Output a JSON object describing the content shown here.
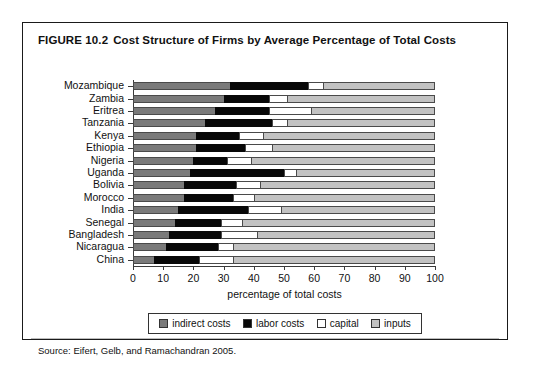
{
  "figure": {
    "number": "FIGURE 10.2",
    "title": "Cost Structure of Firms by Average Percentage of Total Costs",
    "source": "Source: Eifert, Gelb, and Ramachandran 2005."
  },
  "colors": {
    "indirect": "#7a7a7a",
    "labor": "#080808",
    "capital": "#ffffff",
    "inputs": "#c2c2c2",
    "frame": "#1a1a1a",
    "axis": "#3a3a3a"
  },
  "chart_data": {
    "type": "bar",
    "orientation": "horizontal",
    "stacked": true,
    "stacked_mode": "percent",
    "title": "Cost Structure of Firms by Average Percentage of Total Costs",
    "xlabel": "percentage of total costs",
    "ylabel": "",
    "xlim": [
      0,
      100
    ],
    "xticks": [
      0,
      10,
      20,
      30,
      40,
      50,
      60,
      70,
      80,
      90,
      100
    ],
    "xticklabels": [
      "0",
      "10",
      "20",
      "30",
      "40",
      "50",
      "60",
      "70",
      "80",
      "90",
      "100"
    ],
    "grid": false,
    "legend_position": "bottom",
    "legend": [
      "indirect costs",
      "labor costs",
      "capital",
      "inputs"
    ],
    "categories": [
      "Mozambique",
      "Zambia",
      "Eritrea",
      "Tanzania",
      "Kenya",
      "Ethiopia",
      "Nigeria",
      "Uganda",
      "Bolivia",
      "Morocco",
      "India",
      "Senegal",
      "Bangladesh",
      "Nicaragua",
      "China"
    ],
    "series": [
      {
        "name": "indirect costs",
        "color": "#7a7a7a",
        "values": [
          32,
          30,
          27,
          24,
          21,
          21,
          20,
          19,
          17,
          17,
          15,
          14,
          12,
          11,
          7
        ]
      },
      {
        "name": "labor costs",
        "color": "#080808",
        "values": [
          26,
          15,
          18,
          22,
          14,
          16,
          11,
          31,
          17,
          16,
          23,
          15,
          17,
          17,
          15
        ]
      },
      {
        "name": "capital",
        "color": "#ffffff",
        "values": [
          5,
          6,
          14,
          5,
          8,
          9,
          8,
          4,
          8,
          7,
          11,
          7,
          12,
          5,
          11
        ]
      },
      {
        "name": "inputs",
        "color": "#c2c2c2",
        "values": [
          37,
          49,
          41,
          49,
          57,
          54,
          61,
          46,
          58,
          60,
          51,
          64,
          59,
          67,
          67
        ]
      }
    ]
  }
}
